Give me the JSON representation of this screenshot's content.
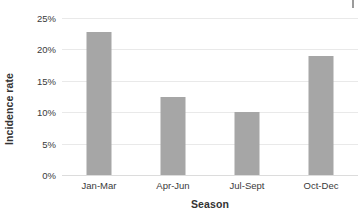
{
  "chart_data": {
    "type": "bar",
    "title": "",
    "subtitle": "",
    "xlabel": "Season",
    "ylabel": "Incidence rate",
    "categories": [
      "Jan-Mar",
      "Apr-Jun",
      "Jul-Sept",
      "Oct-Dec"
    ],
    "values": [
      22.7,
      12.5,
      10.0,
      19.0
    ],
    "value_labels": [
      "22.7%",
      "12.5%",
      "10.0%",
      "19.0%"
    ],
    "ylim": [
      0,
      25
    ],
    "y_ticks": [
      0,
      5,
      10,
      15,
      20,
      25
    ],
    "y_tick_labels": [
      "0%",
      "5%",
      "10%",
      "15%",
      "20%",
      "25%"
    ],
    "grid": "horizontal",
    "legend": "none",
    "bar_color": "#a6a6a6",
    "gridline_color": "#e9e9e9",
    "background_color": "#ffffff",
    "axis_text_color": "#3a3a3a"
  },
  "annotations": {
    "corner_mark": ""
  }
}
